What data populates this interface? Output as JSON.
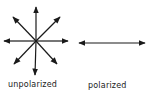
{
  "diagram": {
    "unpolarized": {
      "label": "unpolarized",
      "center": [
        36,
        41
      ],
      "arrow_tips": [
        [
          36,
          7
        ],
        [
          60,
          17
        ],
        [
          68,
          41
        ],
        [
          57,
          64
        ],
        [
          35,
          75
        ],
        [
          14,
          64
        ],
        [
          4,
          41
        ],
        [
          13,
          17
        ]
      ]
    },
    "polarized": {
      "label": "polarized",
      "arrow": {
        "x1": 79,
        "y1": 43,
        "x2": 145,
        "y2": 43
      }
    },
    "colors": {
      "stroke": "#1a1a1a",
      "background": "#ffffff"
    }
  }
}
